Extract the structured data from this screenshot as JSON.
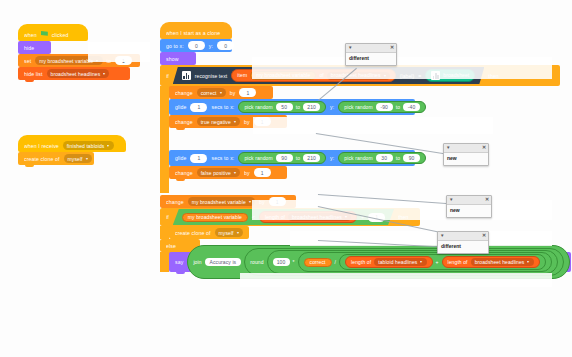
{
  "app": {
    "name": "scratch-block-editor",
    "canvas_background": "#fdfdfd"
  },
  "colors": {
    "events": "#ffbf00",
    "looks": "#9966ff",
    "motion": "#4c97ff",
    "control": "#ffab19",
    "variables": "#ff8c1a",
    "lists": "#ff661a",
    "operators": "#59c059",
    "machine_learning": "#0fbd8c",
    "ml_dark": "#2e3e50"
  },
  "scripts": {
    "stage_setup": {
      "hat": {
        "when": "when",
        "clicked": "clicked",
        "icon": "green-flag-icon"
      },
      "hide": "hide",
      "set": {
        "verb": "set",
        "variable": "my broadsheet variable",
        "to": "to",
        "value": "1"
      },
      "hide_list": {
        "verb": "hide list",
        "list": "broadsheet headlines"
      }
    },
    "receive_script": {
      "hat": {
        "when_i_receive": "when I receive",
        "message": "finished tabloids"
      },
      "clone": {
        "verb": "create clone of",
        "target": "myself"
      }
    },
    "clone_script": {
      "hat": {
        "label": "when I start as a clone"
      },
      "goto": {
        "verb": "go to x:",
        "x": "0",
        "y_label": "y:",
        "y": "0"
      },
      "show": "show",
      "if_block": {
        "if": "if",
        "then": "then",
        "else": "else",
        "condition": {
          "left": {
            "icon": "ml-recognise-icon",
            "verb": "recognise text",
            "item": "item",
            "index_var": "my broadsheet variable",
            "of": "of",
            "list": "broadsheet headlines",
            "label_suffix": "(label)"
          },
          "operator": "=",
          "right": {
            "icon": "ml-label-icon",
            "value": "broadsheet"
          }
        },
        "then_body": [
          {
            "type": "change_var",
            "verb": "change",
            "variable": "correct",
            "by": "by",
            "value": "1"
          },
          {
            "type": "glide",
            "verb": "glide",
            "secs": "1",
            "secs_label": "secs to x:",
            "x_random": {
              "verb": "pick random",
              "from": "50",
              "to_label": "to",
              "to": "210"
            },
            "y_label": "y:",
            "y_random": {
              "verb": "pick random",
              "from": "-90",
              "to_label": "to",
              "to": "-40"
            }
          },
          {
            "type": "change_var",
            "verb": "change",
            "variable": "true negative",
            "by": "by",
            "value": "1"
          },
          {
            "type": "glide",
            "verb": "glide",
            "secs": "1",
            "secs_label": "secs to x:",
            "x_random": {
              "verb": "pick random",
              "from": "90",
              "to_label": "to",
              "to": "210"
            },
            "y_label": "y:",
            "y_random": {
              "verb": "pick random",
              "from": "30",
              "to_label": "to",
              "to": "90"
            }
          },
          {
            "type": "change_var",
            "verb": "change",
            "variable": "false positive",
            "by": "by",
            "value": "1"
          }
        ]
      },
      "change_counter": {
        "verb": "change",
        "variable": "my broadsheet variable",
        "by": "by",
        "value": "1"
      },
      "if2": {
        "if": "if",
        "then": "then",
        "else": "else",
        "condition": {
          "left_var": "my broadsheet variable",
          "operator": "<",
          "right": {
            "length_of": "length of",
            "list": "broadsheet headlines",
            "plus": "+",
            "addend": "1"
          }
        },
        "body": {
          "verb": "create clone of",
          "target": "myself"
        }
      },
      "say_block": {
        "verb": "say",
        "join": "join",
        "text": "Accuracy is",
        "round": "round",
        "hundred": "100",
        "times": "*",
        "correct": "correct",
        "divide": "/",
        "len1": {
          "length_of": "length of",
          "list": "tabloid headlines"
        },
        "plus": "+",
        "len2": {
          "length_of": "length of",
          "list": "broadsheet headlines"
        }
      }
    }
  },
  "popups": [
    {
      "name": "popup-different-top",
      "word": "different",
      "caret": "▼",
      "close": "✕"
    },
    {
      "name": "popup-new-upper",
      "word": "new",
      "caret": "▼",
      "close": "✕"
    },
    {
      "name": "popup-new-lower",
      "word": "new",
      "caret": "▼",
      "close": "✕"
    },
    {
      "name": "popup-different-bottom",
      "word": "different",
      "caret": "▼",
      "close": "✕"
    }
  ]
}
